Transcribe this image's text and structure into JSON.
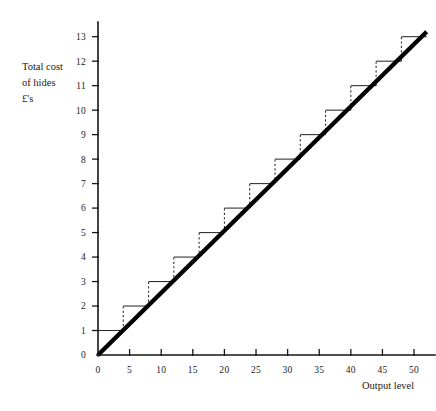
{
  "chart_data": {
    "type": "line",
    "title": "",
    "xlabel": "Output level",
    "ylabel": "Total cost of hides £'s",
    "ylabel_lines": [
      "Total cost",
      "of hides",
      "£'s"
    ],
    "xlim": [
      0,
      53
    ],
    "ylim": [
      0,
      13.6
    ],
    "grid": false,
    "legend": null,
    "x_ticks": [
      0,
      5,
      10,
      15,
      20,
      25,
      30,
      35,
      40,
      45,
      50
    ],
    "x_tick_labels": [
      "0",
      "5",
      "10",
      "15",
      "20",
      "25",
      "30",
      "35",
      "40",
      "45",
      "50"
    ],
    "y_ticks": [
      0,
      1,
      2,
      3,
      4,
      5,
      6,
      7,
      8,
      9,
      10,
      11,
      12,
      13
    ],
    "y_tick_labels": [
      "0",
      "1",
      "2",
      "3",
      "4",
      "5",
      "6",
      "7",
      "8",
      "9",
      "10",
      "11",
      "12",
      "13"
    ],
    "series": [
      {
        "name": "Total cost of hides (step function)",
        "type": "step",
        "step_width": 4,
        "steps": [
          {
            "x_start": 0,
            "x_end": 4,
            "y": 1
          },
          {
            "x_start": 4,
            "x_end": 8,
            "y": 2
          },
          {
            "x_start": 8,
            "x_end": 12,
            "y": 3
          },
          {
            "x_start": 12,
            "x_end": 16,
            "y": 4
          },
          {
            "x_start": 16,
            "x_end": 20,
            "y": 5
          },
          {
            "x_start": 20,
            "x_end": 24,
            "y": 6
          },
          {
            "x_start": 24,
            "x_end": 28,
            "y": 7
          },
          {
            "x_start": 28,
            "x_end": 32,
            "y": 8
          },
          {
            "x_start": 32,
            "x_end": 36,
            "y": 9
          },
          {
            "x_start": 36,
            "x_end": 40,
            "y": 10
          },
          {
            "x_start": 40,
            "x_end": 44,
            "y": 11
          },
          {
            "x_start": 44,
            "x_end": 48,
            "y": 12
          },
          {
            "x_start": 48,
            "x_end": 52,
            "y": 13
          }
        ]
      },
      {
        "name": "Average cost trend line",
        "type": "line",
        "points": [
          [
            0,
            0
          ],
          [
            52,
            13.2
          ]
        ]
      }
    ]
  }
}
